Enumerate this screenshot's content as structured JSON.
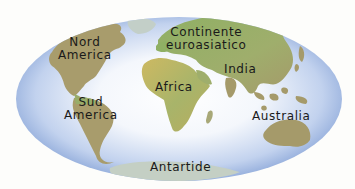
{
  "map": {
    "projection": "elliptical world map",
    "colors": {
      "background": "#fdfdfb",
      "ocean_edge": "#8fa9d8",
      "ocean_center": "#ffffff",
      "land_tan": "#a59a6a",
      "land_green": "#98ad6a",
      "land_yellow": "#c9b660",
      "antarctica": "#c4cfc4",
      "label": "#1a1a1a"
    },
    "labels": {
      "north_america": [
        "Nord",
        "America"
      ],
      "south_america": [
        "Sud",
        "America"
      ],
      "eurasia": [
        "Continente",
        "euroasiatico"
      ],
      "africa": "Africa",
      "india": "India",
      "australia": "Australia",
      "antarctica": "Antartide"
    }
  }
}
